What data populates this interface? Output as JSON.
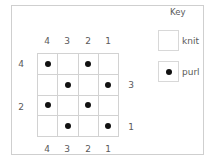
{
  "chart": {
    "column_labels_top": [
      "4",
      "3",
      "2",
      "1"
    ],
    "column_labels_bottom": [
      "4",
      "3",
      "2",
      "1"
    ],
    "row_labels_left": [
      {
        "row_index": 0,
        "label": "4"
      },
      {
        "row_index": 2,
        "label": "2"
      }
    ],
    "row_labels_right": [
      {
        "row_index": 1,
        "label": "3"
      },
      {
        "row_index": 3,
        "label": "1"
      }
    ],
    "rows": [
      [
        "purl",
        "knit",
        "purl",
        "knit"
      ],
      [
        "knit",
        "purl",
        "knit",
        "purl"
      ],
      [
        "purl",
        "knit",
        "purl",
        "knit"
      ],
      [
        "knit",
        "purl",
        "knit",
        "purl"
      ]
    ]
  },
  "key": {
    "title": "Key",
    "items": [
      {
        "stitch": "knit",
        "label": "knit",
        "symbol": "empty-square"
      },
      {
        "stitch": "purl",
        "label": "purl",
        "symbol": "dot"
      }
    ]
  },
  "colors": {
    "grid_line": "#d2d2d2",
    "dot": "#111111",
    "text": "#5a5a5a"
  }
}
